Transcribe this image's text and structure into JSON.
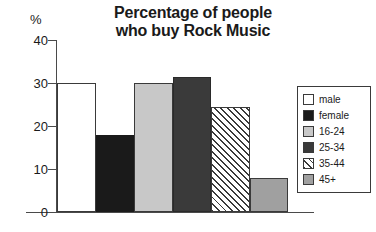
{
  "chart_data": {
    "type": "bar",
    "title": "Percentage of people who buy Rock Music",
    "title_lines": [
      "Percentage of people",
      "who buy Rock Music"
    ],
    "xlabel": "",
    "ylabel": "%",
    "unit_label": "%",
    "ylim": [
      0,
      40
    ],
    "ytick_labels": [
      "40",
      "30",
      "20",
      "10",
      "0"
    ],
    "ytick_values": [
      40,
      30,
      20,
      10,
      0
    ],
    "grid": false,
    "legend_position": "right",
    "categories": [
      "male",
      "female",
      "16-24",
      "25-34",
      "35-44",
      "45+"
    ],
    "values": [
      30,
      18,
      30,
      31.5,
      24.5,
      8
    ],
    "series": [
      {
        "name": "Percentage of people who buy Rock Music",
        "values": [
          30,
          18,
          30,
          31.5,
          24.5,
          8
        ]
      }
    ],
    "bars": [
      {
        "label": "male",
        "value": 30,
        "fill": "white",
        "color": "#ffffff"
      },
      {
        "label": "female",
        "value": 18,
        "fill": "black",
        "color": "#1a1a1a"
      },
      {
        "label": "16-24",
        "value": 30,
        "fill": "lgray",
        "color": "#c8c8c8"
      },
      {
        "label": "25-34",
        "value": 31.5,
        "fill": "dgray",
        "color": "#3a3a3a"
      },
      {
        "label": "35-44",
        "value": 24.5,
        "fill": "hatch",
        "color": "#ffffff"
      },
      {
        "label": "45+",
        "value": 8,
        "fill": "mgray",
        "color": "#a0a0a0"
      }
    ],
    "legend": [
      {
        "label": "male",
        "fill": "white"
      },
      {
        "label": "female",
        "fill": "black"
      },
      {
        "label": "16-24",
        "fill": "lgray"
      },
      {
        "label": "25-34",
        "fill": "dgray"
      },
      {
        "label": "35-44",
        "fill": "hatch"
      },
      {
        "label": "45+",
        "fill": "mgray"
      }
    ]
  }
}
